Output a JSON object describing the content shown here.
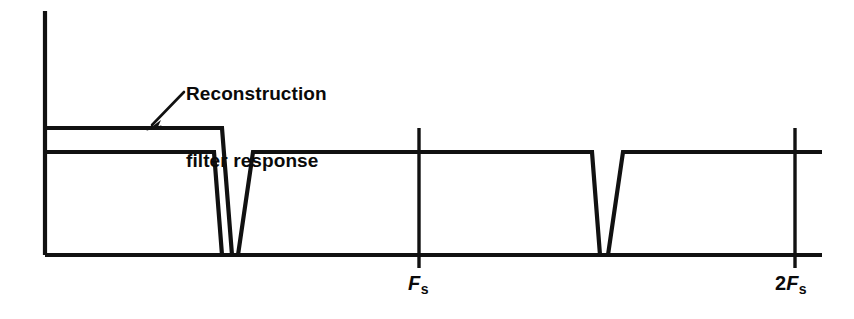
{
  "figure": {
    "background_color": "#ffffff",
    "ink_color": "#111111",
    "annotation": {
      "line1": "Reconstruction",
      "line2": "filter response",
      "pointer": "arrow-down-left"
    },
    "axis": {
      "y_axis_label": "",
      "x_axis_label": "",
      "origin_x": 45,
      "baseline_y": 255,
      "y_axis_top": 11,
      "x_axis_right": 822
    },
    "ticks": [
      {
        "id": "fs",
        "lead": "",
        "symbol": "F",
        "subscript": "s",
        "text": "Fs",
        "x": 419
      },
      {
        "id": "two_fs",
        "lead": "2",
        "symbol": "F",
        "subscript": "s",
        "text": "2Fs",
        "x": 795
      }
    ]
  },
  "chart_data": {
    "type": "line",
    "title": "",
    "subtitle": "",
    "xlabel": "",
    "ylabel": "",
    "grid": false,
    "legend": "none",
    "x_tick_labels": [
      "Fs",
      "2Fs"
    ],
    "x_tick_values": [
      1,
      2
    ],
    "x_tick_pixels": [
      419,
      795
    ],
    "xlim_pixels": [
      45,
      822
    ],
    "ylim_pixels": [
      255,
      11
    ],
    "levels": {
      "baseline_y": 255,
      "signal_plateau_y": 152,
      "filter_plateau_y": 128
    },
    "annotations": [
      {
        "text": "Reconstruction filter response",
        "lines": [
          "Reconstruction",
          "filter response"
        ],
        "text_x": 186,
        "text_y": 47,
        "arrow_from": [
          183,
          93
        ],
        "arrow_to": [
          148,
          128
        ]
      }
    ],
    "series": [
      {
        "name": "Reconstruction filter response",
        "description": "Outer taller trapezoid over baseband, flat top then sloped rolloff",
        "points_pixels": [
          [
            45,
            128
          ],
          [
            222,
            128
          ],
          [
            232,
            255
          ]
        ]
      },
      {
        "name": "Sampled signal spectrum",
        "description": "Baseband trapezoid plus images repeating at Fs and 2Fs",
        "points_pixels": [
          [
            45,
            152
          ],
          [
            214,
            152
          ],
          [
            222,
            255
          ],
          [
            238,
            255
          ],
          [
            253,
            152
          ],
          [
            592,
            152
          ],
          [
            600,
            255
          ],
          [
            608,
            255
          ],
          [
            623,
            152
          ],
          [
            822,
            152
          ]
        ]
      }
    ]
  }
}
